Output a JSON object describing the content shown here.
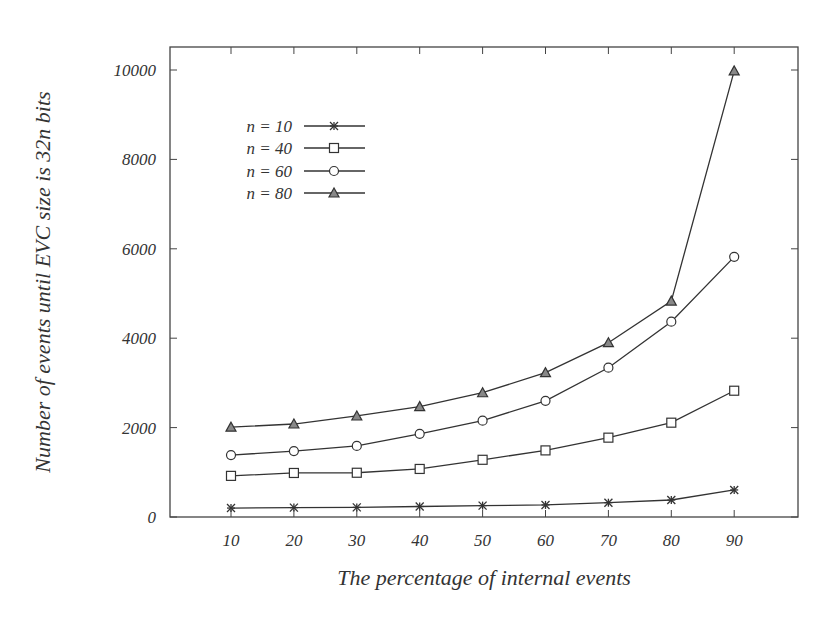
{
  "chart_data": {
    "type": "line",
    "title": "",
    "xlabel": "The percentage of internal events",
    "ylabel": "Number of events until EVC size is 32n bits",
    "x": [
      10,
      20,
      30,
      40,
      50,
      60,
      70,
      80,
      90
    ],
    "xlim": [
      0,
      100
    ],
    "ylim": [
      0,
      10500
    ],
    "xticks": [
      "10",
      "20",
      "30",
      "40",
      "50",
      "60",
      "70",
      "80",
      "90"
    ],
    "yticks": [
      "0",
      "2000",
      "4000",
      "6000",
      "8000",
      "10000"
    ],
    "grid": false,
    "legend_position": "upper-left",
    "series": [
      {
        "name": "n = 10",
        "marker": "star",
        "values": [
          200,
          210,
          215,
          235,
          255,
          270,
          320,
          380,
          605
        ]
      },
      {
        "name": "n = 40",
        "marker": "square",
        "values": [
          920,
          985,
          990,
          1075,
          1280,
          1490,
          1775,
          2110,
          2825
        ]
      },
      {
        "name": "n = 60",
        "marker": "circle",
        "values": [
          1385,
          1475,
          1590,
          1860,
          2155,
          2600,
          3340,
          4370,
          5820
        ]
      },
      {
        "name": "n = 80",
        "marker": "triangle",
        "values": [
          2010,
          2080,
          2260,
          2470,
          2780,
          3230,
          3900,
          4830,
          9980
        ]
      }
    ]
  },
  "colors": {
    "line": "#333333",
    "frame": "#444444",
    "background": "#ffffff"
  }
}
